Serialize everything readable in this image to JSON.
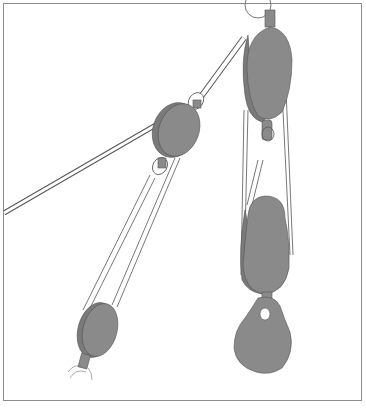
{
  "illustration": {
    "subject": "block and tackle pulley system",
    "colors": {
      "block_fill": "#8a8a8a",
      "outline": "#555555",
      "rope": "#ffffff",
      "frame": "#8c8c8c"
    }
  }
}
